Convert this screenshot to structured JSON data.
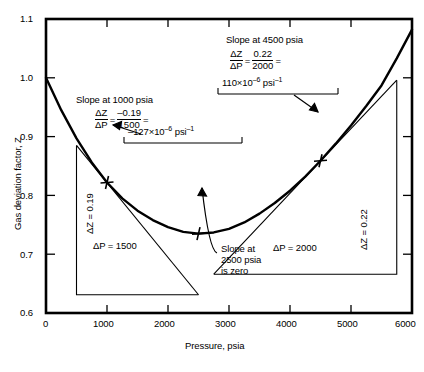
{
  "chart_data": {
    "type": "line",
    "title": "",
    "xlabel": "Pressure, psia",
    "ylabel": "Gas deviation factor, Z",
    "xlim": [
      0,
      6000
    ],
    "ylim": [
      0.6,
      1.1
    ],
    "xticks": [
      "0",
      "1000",
      "2000",
      "3000",
      "4000",
      "5000",
      "6000"
    ],
    "yticks": [
      "0.6",
      "0.7",
      "0.8",
      "0.9",
      "1.0",
      "1.1"
    ],
    "grid": false,
    "legend": null,
    "series": [
      {
        "name": "Gas deviation factor curve",
        "x": [
          0,
          250,
          500,
          750,
          1000,
          1250,
          1500,
          1750,
          2000,
          2250,
          2500,
          2750,
          3000,
          3250,
          3500,
          3750,
          4000,
          4250,
          4500,
          4750,
          5000,
          5250,
          5500,
          5750,
          6000
        ],
        "y": [
          1.0,
          0.945,
          0.897,
          0.856,
          0.822,
          0.795,
          0.774,
          0.758,
          0.746,
          0.738,
          0.735,
          0.737,
          0.743,
          0.754,
          0.769,
          0.787,
          0.808,
          0.832,
          0.859,
          0.888,
          0.919,
          0.952,
          0.987,
          1.033,
          1.082
        ]
      },
      {
        "name": "Tangent line at 1000 psia",
        "x": [
          500,
          2500
        ],
        "y": [
          0.885,
          0.631
        ]
      },
      {
        "name": "Tangent line at 4500 psia",
        "x": [
          2750,
          5750
        ],
        "y": [
          0.666,
          0.996
        ]
      }
    ],
    "markers": [
      {
        "label": "tangent point 1000 psia",
        "x": 1000,
        "y": 0.822
      },
      {
        "label": "minimum point 2500 psia",
        "x": 2500,
        "y": 0.735
      },
      {
        "label": "tangent point 4500 psia",
        "x": 4500,
        "y": 0.859
      }
    ],
    "annotations": {
      "slope_1000": {
        "heading": "Slope at 1000 psia",
        "numerator_symbol": "ΔZ",
        "denominator_symbol": "ΔP",
        "equals": "=",
        "value_numerator": "–0.19",
        "value_denominator": "1500",
        "trailing_equals": "=",
        "result": "–127×10",
        "result_exponent": "–6",
        "result_units": "psi",
        "result_units_exponent": "–1"
      },
      "slope_4500": {
        "heading": "Slope at 4500 psia",
        "numerator_symbol": "ΔZ",
        "denominator_symbol": "ΔP",
        "equals": "=",
        "value_numerator": "0.22",
        "value_denominator": "2000",
        "trailing_equals": "=",
        "result": "110×10",
        "result_exponent": "–6",
        "result_units": "psi",
        "result_units_exponent": "–1"
      },
      "slope_2500": {
        "line1": "Slope at",
        "line2": "2500 psia",
        "line3": "is zero"
      },
      "triangle_left": {
        "delta_z": "ΔZ = 0.19",
        "delta_p": "ΔP = 1500"
      },
      "triangle_right": {
        "delta_z": "ΔZ = 0.22",
        "delta_p": "ΔP = 2000"
      }
    },
    "colors": {
      "curve": "#000000",
      "axis": "#000000",
      "background": "#ffffff"
    }
  }
}
